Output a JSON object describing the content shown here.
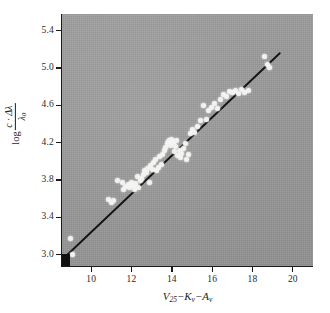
{
  "figure": {
    "background_color": "#ffffff",
    "panel_color": "#9c9c9c",
    "ink_color": "#1a1a1a",
    "marker_color": "#f2f2f0"
  },
  "axes": {
    "x_title_parts": {
      "v": "V",
      "v_sub": "25",
      "minus1": "−",
      "k": "K",
      "k_sub": "v",
      "minus2": "−",
      "a": "A",
      "a_sub": "v"
    },
    "y_title_parts": {
      "log": "log",
      "numerator": "c · Δλ",
      "denominator": "λ",
      "denominator_sub": "0"
    },
    "x_ticks": [
      10,
      12,
      14,
      16,
      18,
      20
    ],
    "x_tick_labels": [
      "10",
      "12",
      "14",
      "16",
      "18",
      "20"
    ],
    "y_ticks": [
      3.0,
      3.4,
      3.8,
      4.2,
      4.6,
      5.0,
      5.4
    ],
    "y_tick_labels": [
      "3.0",
      "3.4",
      "3.8",
      "4.2",
      "4.6",
      "5.0",
      "5.4"
    ],
    "xlim": [
      8.55,
      21.0
    ],
    "ylim": [
      2.88,
      5.58
    ],
    "grid": false
  },
  "chart_data": {
    "type": "scatter",
    "title": "",
    "xlabel": "V25 - Kv - Av",
    "ylabel": "log c·Δλ/λ0",
    "xlim": [
      8.55,
      21.0
    ],
    "ylim": [
      2.88,
      5.58
    ],
    "grid": false,
    "legend": null,
    "series": [
      {
        "name": "fit-line",
        "type": "line",
        "x": [
          8.62,
          19.35
        ],
        "y": [
          2.96,
          5.16
        ]
      },
      {
        "name": "origin-marker",
        "type": "scatter",
        "marker": "filled-square",
        "x": [
          8.68
        ],
        "y": [
          2.95
        ]
      },
      {
        "name": "observations",
        "type": "scatter",
        "marker": "open-circle-white",
        "x": [
          8.95,
          9.05,
          10.85,
          11.0,
          11.12,
          11.3,
          11.55,
          11.62,
          11.72,
          11.85,
          11.92,
          12.02,
          12.08,
          12.15,
          12.22,
          12.28,
          12.35,
          12.42,
          12.5,
          12.58,
          12.64,
          12.72,
          12.8,
          12.88,
          12.95,
          13.02,
          13.1,
          13.18,
          13.25,
          13.32,
          13.4,
          13.48,
          13.55,
          13.62,
          13.7,
          13.76,
          13.82,
          13.88,
          13.94,
          14.0,
          14.06,
          14.12,
          14.18,
          14.24,
          14.3,
          14.36,
          14.42,
          14.5,
          14.58,
          14.66,
          14.74,
          14.82,
          14.9,
          15.0,
          15.1,
          15.25,
          15.4,
          15.55,
          15.7,
          15.82,
          15.95,
          16.1,
          16.25,
          16.4,
          16.55,
          16.7,
          16.85,
          17.0,
          17.15,
          17.3,
          17.45,
          17.6,
          17.8,
          18.6,
          18.75,
          18.85
        ],
        "y": [
          3.18,
          3.0,
          3.59,
          3.56,
          3.58,
          3.8,
          3.78,
          3.7,
          3.73,
          3.75,
          3.72,
          3.78,
          3.74,
          3.7,
          3.76,
          3.84,
          3.72,
          3.8,
          3.82,
          3.86,
          3.9,
          3.88,
          3.93,
          3.78,
          3.96,
          3.91,
          3.99,
          4.02,
          3.9,
          3.94,
          4.05,
          3.97,
          4.08,
          4.12,
          4.15,
          4.19,
          4.21,
          4.22,
          4.17,
          4.24,
          4.2,
          4.11,
          4.16,
          4.23,
          4.06,
          4.12,
          4.04,
          4.09,
          4.14,
          4.19,
          4.02,
          4.08,
          4.3,
          4.34,
          4.31,
          4.38,
          4.44,
          4.6,
          4.45,
          4.55,
          4.58,
          4.62,
          4.57,
          4.66,
          4.72,
          4.7,
          4.75,
          4.74,
          4.76,
          4.73,
          4.77,
          4.74,
          4.76,
          5.13,
          5.04,
          5.01
        ]
      }
    ]
  }
}
